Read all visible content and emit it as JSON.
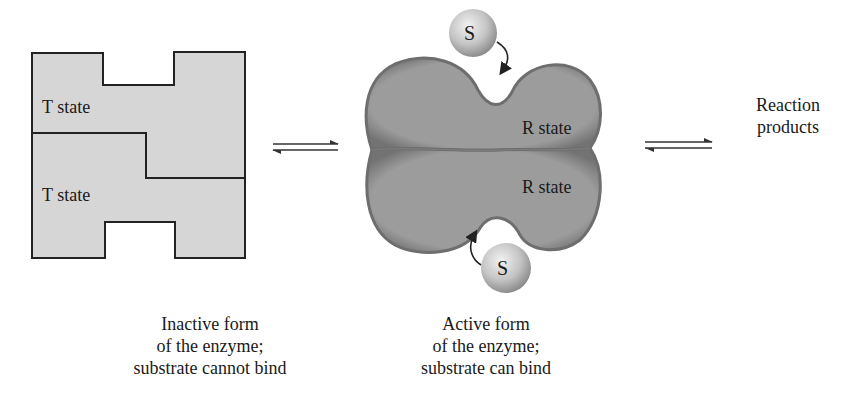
{
  "inactive": {
    "top_label": "T state",
    "bottom_label": "T state",
    "caption": [
      "Inactive form",
      "of the enzyme;",
      "substrate cannot bind"
    ]
  },
  "active": {
    "top_label": "R state",
    "bottom_label": "R state",
    "substrate_top": "S",
    "substrate_bottom": "S",
    "caption": [
      "Active form",
      "of the enzyme;",
      "substrate can bind"
    ]
  },
  "products": {
    "label": [
      "Reaction",
      "products"
    ]
  },
  "colors": {
    "t_fill": "#d6d6d6",
    "t_stroke": "#222222",
    "r_fill": "#9a9a9a",
    "r_edge": "#6e6e6e",
    "substrate": "#c8c8c8"
  }
}
